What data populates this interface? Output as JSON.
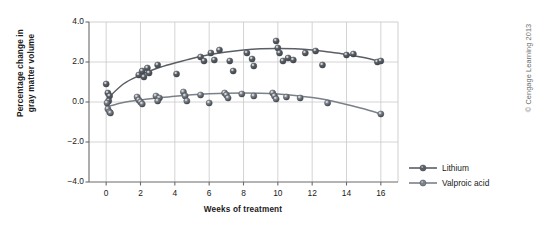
{
  "chart_data": {
    "type": "scatter",
    "title": "",
    "xlabel": "Weeks of treatment",
    "ylabel": "Percentage change in\ngray matter volume",
    "xlim": [
      -1,
      17
    ],
    "ylim": [
      -4.0,
      4.0
    ],
    "xticks": [
      0,
      2,
      4,
      6,
      8,
      10,
      12,
      14,
      16
    ],
    "xtick_labels": [
      "0",
      "2",
      "4",
      "6",
      "8",
      "10",
      "12",
      "14",
      "16"
    ],
    "yticks": [
      -4.0,
      -2.0,
      0.0,
      2.0,
      4.0
    ],
    "ytick_labels": [
      "-4.0",
      "-2.0",
      "0.0",
      "2.0",
      "4.0"
    ],
    "grid": true,
    "legend_position": "outside right bottom",
    "series": [
      {
        "name": "Lithium",
        "color": "#5a5f66",
        "marker": "sphere",
        "points": [
          [
            0.0,
            0.9
          ],
          [
            0.1,
            0.45
          ],
          [
            0.2,
            0.3
          ],
          [
            0.15,
            0.05
          ],
          [
            1.9,
            1.35
          ],
          [
            2.1,
            1.55
          ],
          [
            2.2,
            1.25
          ],
          [
            2.4,
            1.7
          ],
          [
            2.5,
            1.45
          ],
          [
            3.0,
            1.85
          ],
          [
            4.1,
            1.4
          ],
          [
            5.5,
            2.25
          ],
          [
            5.7,
            2.05
          ],
          [
            6.1,
            2.45
          ],
          [
            6.3,
            2.1
          ],
          [
            6.6,
            2.6
          ],
          [
            7.2,
            2.05
          ],
          [
            7.4,
            1.55
          ],
          [
            8.2,
            2.45
          ],
          [
            8.5,
            2.15
          ],
          [
            8.6,
            1.8
          ],
          [
            9.9,
            3.05
          ],
          [
            10.0,
            2.7
          ],
          [
            10.1,
            2.45
          ],
          [
            10.3,
            2.05
          ],
          [
            10.6,
            2.2
          ],
          [
            10.9,
            2.1
          ],
          [
            11.6,
            2.45
          ],
          [
            12.2,
            2.55
          ],
          [
            12.6,
            1.85
          ],
          [
            14.0,
            2.35
          ],
          [
            14.4,
            2.4
          ],
          [
            15.8,
            2.0
          ],
          [
            16.0,
            2.05
          ]
        ]
      },
      {
        "name": "Valproic acid",
        "color": "#7b818a",
        "marker": "sphere",
        "points": [
          [
            0.05,
            -0.05
          ],
          [
            0.1,
            -0.35
          ],
          [
            0.2,
            -0.5
          ],
          [
            0.25,
            -0.55
          ],
          [
            1.8,
            0.25
          ],
          [
            1.9,
            0.1
          ],
          [
            2.0,
            0.0
          ],
          [
            2.1,
            -0.1
          ],
          [
            2.9,
            0.3
          ],
          [
            3.1,
            0.2
          ],
          [
            3.0,
            0.05
          ],
          [
            4.5,
            0.5
          ],
          [
            4.6,
            0.3
          ],
          [
            4.7,
            0.05
          ],
          [
            5.5,
            0.35
          ],
          [
            6.0,
            -0.05
          ],
          [
            6.9,
            0.45
          ],
          [
            7.0,
            0.35
          ],
          [
            7.1,
            0.2
          ],
          [
            7.9,
            0.4
          ],
          [
            8.6,
            0.3
          ],
          [
            9.7,
            0.45
          ],
          [
            9.8,
            0.3
          ],
          [
            9.9,
            0.15
          ],
          [
            10.5,
            0.25
          ],
          [
            11.3,
            0.2
          ],
          [
            12.9,
            -0.05
          ],
          [
            16.0,
            -0.6
          ]
        ]
      }
    ],
    "trend_lines": [
      {
        "name": "Lithium",
        "color": "#5a5f66",
        "path": [
          [
            0.0,
            0.1
          ],
          [
            1.0,
            0.9
          ],
          [
            2.0,
            1.35
          ],
          [
            3.0,
            1.7
          ],
          [
            4.0,
            1.95
          ],
          [
            5.0,
            2.18
          ],
          [
            6.0,
            2.36
          ],
          [
            7.0,
            2.5
          ],
          [
            8.0,
            2.6
          ],
          [
            9.0,
            2.66
          ],
          [
            10.0,
            2.68
          ],
          [
            11.0,
            2.66
          ],
          [
            12.0,
            2.6
          ],
          [
            13.0,
            2.5
          ],
          [
            14.0,
            2.38
          ],
          [
            15.0,
            2.22
          ],
          [
            16.0,
            2.02
          ]
        ]
      },
      {
        "name": "Valproic acid",
        "color": "#7b818a",
        "path": [
          [
            0.0,
            -0.25
          ],
          [
            1.0,
            -0.02
          ],
          [
            2.0,
            0.1
          ],
          [
            3.0,
            0.2
          ],
          [
            4.0,
            0.29
          ],
          [
            5.0,
            0.36
          ],
          [
            6.0,
            0.41
          ],
          [
            7.0,
            0.44
          ],
          [
            8.0,
            0.45
          ],
          [
            9.0,
            0.44
          ],
          [
            10.0,
            0.4
          ],
          [
            11.0,
            0.33
          ],
          [
            12.0,
            0.22
          ],
          [
            13.0,
            0.08
          ],
          [
            14.0,
            -0.12
          ],
          [
            15.0,
            -0.34
          ],
          [
            16.0,
            -0.6
          ]
        ]
      }
    ]
  },
  "legend": {
    "items": [
      {
        "label": "Lithium",
        "color": "#5a5f66"
      },
      {
        "label": "Valproic acid",
        "color": "#7b818a"
      }
    ]
  },
  "credit": "© Cengage Learning 2013",
  "colors": {
    "axis": "#6b6b6b",
    "grid": "#c9c9c9",
    "text": "#1a1a1a",
    "lithium": "#5a5f66",
    "valproic": "#7b818a",
    "credit": "#6d6d6d"
  }
}
